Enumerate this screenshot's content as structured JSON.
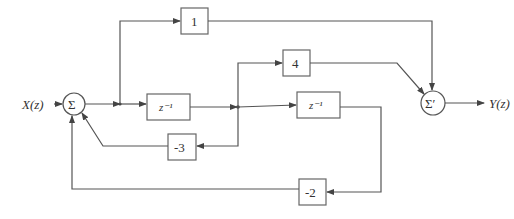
{
  "diagram": {
    "input_label": "X(z)",
    "output_label": "Y(z)",
    "summers": [
      {
        "id": "sum1",
        "symbol": "Σ"
      },
      {
        "id": "sum2",
        "symbol": "Σ′"
      }
    ],
    "blocks": [
      {
        "id": "gain-1",
        "label": "1"
      },
      {
        "id": "delay-1",
        "label": "z⁻¹"
      },
      {
        "id": "gain-4",
        "label": "4"
      },
      {
        "id": "delay-2",
        "label": "z⁻¹"
      },
      {
        "id": "gain-neg3",
        "label": "-3"
      },
      {
        "id": "gain-neg2",
        "label": "-2"
      }
    ],
    "colors": {
      "line": "#555555",
      "box_border": "#666666",
      "text": "#333333",
      "background": "#ffffff"
    }
  }
}
